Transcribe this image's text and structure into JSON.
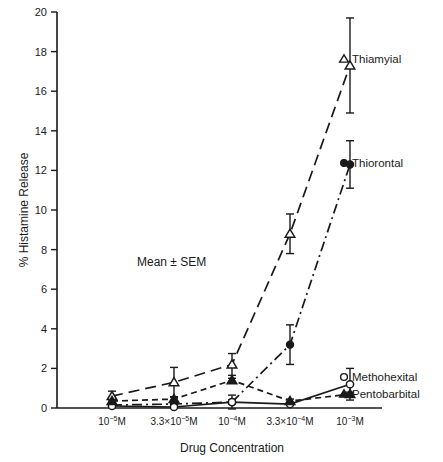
{
  "chart_data": {
    "type": "line",
    "title": "",
    "xlabel": "Drug Concentration",
    "ylabel": "% Histamine Release",
    "annotation": "Mean ± SEM",
    "grid": false,
    "legend_position": "right-inline",
    "ylim": [
      0,
      20
    ],
    "yticks": [
      0,
      2,
      4,
      6,
      8,
      10,
      12,
      14,
      16,
      18,
      20
    ],
    "ytick_labels": [
      "0",
      "2",
      "4",
      "6",
      "8",
      "10",
      "12",
      "14",
      "16",
      "18",
      "20"
    ],
    "categories": [
      "10−5M",
      "3.3×10−5M",
      "10−4M",
      "3.3×10−4M",
      "10−3M"
    ],
    "xtick_labels": [
      {
        "mantissa": "10",
        "exponent": "−5",
        "unit": "M",
        "prefix": ""
      },
      {
        "mantissa": "10",
        "exponent": "−5",
        "unit": "M",
        "prefix": "3.3×"
      },
      {
        "mantissa": "10",
        "exponent": "−4",
        "unit": "M",
        "prefix": ""
      },
      {
        "mantissa": "10",
        "exponent": "−4",
        "unit": "M",
        "prefix": "3.3×"
      },
      {
        "mantissa": "10",
        "exponent": "−3",
        "unit": "M",
        "prefix": ""
      }
    ],
    "series": [
      {
        "name": "Thiamyial",
        "label": "Thiamyial",
        "marker": "open-triangle",
        "line_style": "dashed",
        "color": "#1a1a1a",
        "values": [
          0.6,
          1.3,
          2.2,
          8.8,
          17.3
        ],
        "errors": [
          0.25,
          0.75,
          0.55,
          1.0,
          2.4
        ]
      },
      {
        "name": "Thiorontal",
        "label": "Thiorontal",
        "marker": "filled-circle",
        "line_style": "dash-dot",
        "color": "#1a1a1a",
        "values": [
          0.15,
          0.2,
          0.3,
          3.2,
          12.3
        ],
        "errors": [
          0.1,
          0.1,
          0.1,
          1.0,
          1.2
        ]
      },
      {
        "name": "Methohexital",
        "label": "Methohexital",
        "marker": "open-circle",
        "line_style": "solid",
        "color": "#1a1a1a",
        "values": [
          0.1,
          0.05,
          0.3,
          0.2,
          1.2
        ],
        "errors": [
          0.05,
          0.05,
          0.35,
          0.05,
          0.8
        ]
      },
      {
        "name": "Pentobarbital",
        "label": "Pentobarbital",
        "marker": "filled-triangle",
        "line_style": "dashed-short",
        "color": "#1a1a1a",
        "values": [
          0.35,
          0.45,
          1.4,
          0.35,
          0.7
        ],
        "errors": [
          0.1,
          0.12,
          0.1,
          0.1,
          0.1
        ]
      }
    ]
  },
  "axis": {
    "y_title": "% Histamine Release",
    "x_title": "Drug Concentration"
  },
  "labels": {
    "thiamyial": "Thiamyial",
    "thiorontal": "Thiorontal",
    "methohexital": "Methohexital",
    "pentobarbital": "Pentobarbital",
    "mean_sem": "Mean ± SEM"
  },
  "ticks": {
    "y": [
      "0",
      "2",
      "4",
      "6",
      "8",
      "10",
      "12",
      "14",
      "16",
      "18",
      "20"
    ]
  }
}
